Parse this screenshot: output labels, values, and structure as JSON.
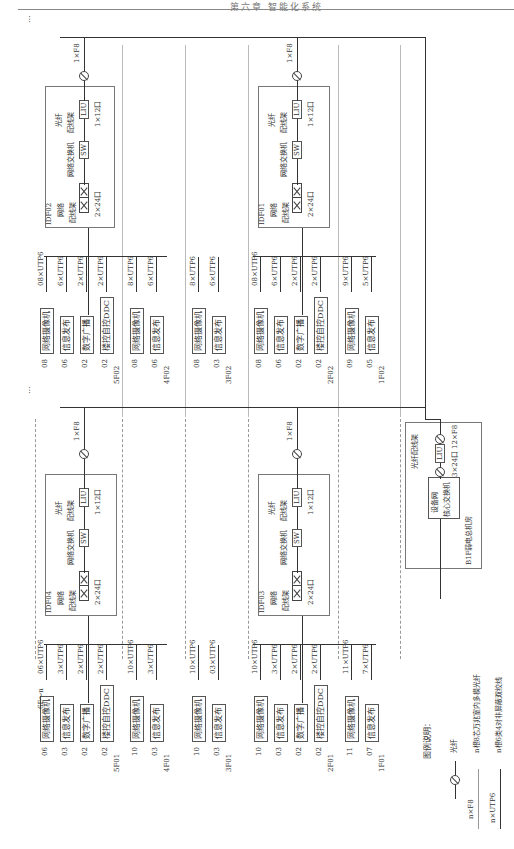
{
  "header": {
    "title": "第六章 智能化系统"
  },
  "continuation_mark": "...",
  "legend": {
    "title": "图例说明：",
    "items": [
      {
        "symbol": "fiber-icon",
        "code": "",
        "desc": "光纤"
      },
      {
        "symbol": "line",
        "code": "n×F8",
        "desc": "n根8芯万兆室内多模光纤"
      },
      {
        "symbol": "line",
        "code": "n×UTP6",
        "desc": "n根6类4对非屏蔽双绞线"
      }
    ]
  },
  "core_room": {
    "room_label": "B1F弱电总机房",
    "switch_label_1": "设备网",
    "switch_label_2": "核心交换机",
    "odf_label": "光纤配线架",
    "liu": "LIU",
    "ports": "3×24口",
    "uplink": "12×F8"
  },
  "idf_common": {
    "patch_label_1": "网络",
    "patch_label_2": "配线架",
    "patch_ports": "2×24口",
    "switch_label": "网络交换机",
    "sw": "SW",
    "odf_label_1": "光纤",
    "odf_label_2": "配线架",
    "liu": "LIU",
    "liu_ports": "1×12口",
    "uplink": "1×F8"
  },
  "idfs": [
    {
      "id": "IDF02",
      "side": "east-upper"
    },
    {
      "id": "IDF01",
      "side": "east-lower"
    },
    {
      "id": "IDF04",
      "side": "west-upper"
    },
    {
      "id": "IDF03",
      "side": "west-lower"
    }
  ],
  "top_label": "6F～n",
  "floors_east": [
    {
      "floor": "5F02",
      "items": [
        {
          "qty": "08",
          "name": "网络摄像机",
          "cable": "08×UTP6"
        },
        {
          "qty": "06",
          "name": "信息发布",
          "cable": "6×UTP6"
        },
        {
          "qty": "02",
          "name": "数字广播",
          "cable": "2×UTP6"
        },
        {
          "qty": "02",
          "name": "楼控自控DDC",
          "cable": "2×UTP6"
        }
      ]
    },
    {
      "floor": "4F02",
      "items": [
        {
          "qty": "08",
          "name": "网络摄像机",
          "cable": "8×UTP6"
        },
        {
          "qty": "06",
          "name": "信息发布",
          "cable": "6×UTP6"
        }
      ]
    },
    {
      "floor": "3F02",
      "items": [
        {
          "qty": "08",
          "name": "网络摄像机",
          "cable": "8×UTP6"
        },
        {
          "qty": "03",
          "name": "信息发布",
          "cable": "6×UTP6"
        }
      ]
    },
    {
      "floor": "2F02",
      "items": [
        {
          "qty": "08",
          "name": "网络摄像机",
          "cable": "08×UTP6"
        },
        {
          "qty": "06",
          "name": "信息发布",
          "cable": "6×UTP6"
        },
        {
          "qty": "02",
          "name": "数字广播",
          "cable": "2×UTP6"
        },
        {
          "qty": "02",
          "name": "楼控自控DDC",
          "cable": "2×UTP6"
        }
      ]
    },
    {
      "floor": "1F02",
      "items": [
        {
          "qty": "09",
          "name": "网络摄像机",
          "cable": "9×UTP6"
        },
        {
          "qty": "05",
          "name": "信息发布",
          "cable": "5×UTP6"
        }
      ]
    }
  ],
  "floors_west": [
    {
      "floor": "5F01",
      "items": [
        {
          "qty": "06",
          "name": "网络摄像机",
          "cable": "06×UTP6"
        },
        {
          "qty": "03",
          "name": "信息发布",
          "cable": "3×UTP6"
        },
        {
          "qty": "02",
          "name": "数字广播",
          "cable": "2×UTP6"
        },
        {
          "qty": "02",
          "name": "楼控自控DDC",
          "cable": "2×UTP6"
        }
      ]
    },
    {
      "floor": "4F01",
      "items": [
        {
          "qty": "10",
          "name": "网络摄像机",
          "cable": "10×UTP6"
        },
        {
          "qty": "03",
          "name": "信息发布",
          "cable": "3×UTP6"
        }
      ]
    },
    {
      "floor": "3F01",
      "items": [
        {
          "qty": "10",
          "name": "网络摄像机",
          "cable": "10×UTP6"
        },
        {
          "qty": "03",
          "name": "信息发布",
          "cable": "03×UTP6"
        }
      ]
    },
    {
      "floor": "2F01",
      "items": [
        {
          "qty": "10",
          "name": "网络摄像机",
          "cable": "10×UTP6"
        },
        {
          "qty": "03",
          "name": "信息发布",
          "cable": "3×UTP6"
        },
        {
          "qty": "02",
          "name": "数字广播",
          "cable": "2×UTP6"
        },
        {
          "qty": "02",
          "name": "楼控自控DDC",
          "cable": "2×UTP6"
        }
      ]
    },
    {
      "floor": "1F01",
      "items": [
        {
          "qty": "11",
          "name": "网络摄像机",
          "cable": "11×UTP6"
        },
        {
          "qty": "07",
          "name": "信息发布",
          "cable": "7×UTP6"
        }
      ]
    }
  ]
}
